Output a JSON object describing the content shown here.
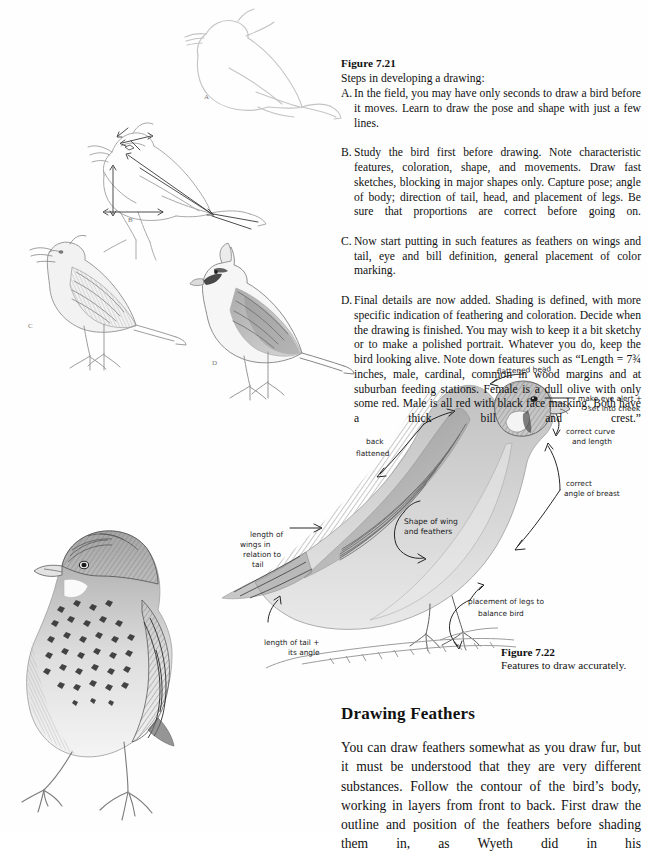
{
  "figure_721": {
    "heading": "Figure 7.21",
    "subtitle": "Steps in developing a drawing:",
    "steps": [
      {
        "letter": "A.",
        "text": "In the field, you may have only seconds to draw a bird before it moves. Learn to draw the pose and shape with just a few lines."
      },
      {
        "letter": "B.",
        "text": "Study the bird first before drawing. Note characteristic features, coloration, shape, and movements. Draw fast sketches, blocking in major shapes only. Capture pose; angle of body; direction of tail, head, and placement of legs. Be sure that proportions are correct before going on."
      },
      {
        "letter": "C.",
        "text": "Now start putting in such features as feathers on wings and tail, eye and bill definition, general placement of color marking."
      },
      {
        "letter": "D.",
        "text": "Final details are now added. Shading is defined, with more specific indication of feathering and coloration. Decide when the drawing is finished. You may wish to keep it a bit sketchy or to make a polished portrait. Whatever you do, keep the bird looking alive. Note down features such as “Length = 7¾ inches, male, cardinal, common in wood margins and at suburban feeding stations. Female is a dull olive with only some red. Male is all red with black face marking. Both have a thick bill and crest.”"
      }
    ]
  },
  "sketch_labels": {
    "a": "A",
    "b": "B",
    "c": "C",
    "d": "D"
  },
  "figure_722": {
    "heading": "Figure 7.22",
    "caption": "Features to draw accurately.",
    "annotations": [
      {
        "id": "flattened-head",
        "text": "flattened head"
      },
      {
        "id": "make-eye-alert",
        "line1": "make eye alert +",
        "line2": "set into cheek"
      },
      {
        "id": "correct-curve",
        "line1": "correct curve",
        "line2": "and length"
      },
      {
        "id": "back-flattened",
        "line1": "back",
        "line2": "flattened"
      },
      {
        "id": "correct-angle-breast",
        "line1": "correct",
        "line2": "angle of breast"
      },
      {
        "id": "shape-of-wing",
        "line1": "Shape of wing",
        "line2": "and feathers"
      },
      {
        "id": "length-of-wings",
        "line1": "length of",
        "line2": "wings in",
        "line3": "relation to",
        "line4": "tail"
      },
      {
        "id": "placement-of-legs",
        "line1": "placement of legs to",
        "line2": "balance bird"
      },
      {
        "id": "length-of-tail",
        "line1": "length of tail +",
        "line2": "its angle"
      }
    ]
  },
  "section_feathers": {
    "heading": "Drawing Feathers",
    "body": "You can draw feathers somewhat as you draw fur, but it must be understood that they are very different substances. Follow the contour of the bird’s body, working in layers from front to back. First draw the outline and position of the feathers before shading them in, as Wyeth did in his"
  },
  "colors": {
    "ink": "#111111",
    "pencil": "#6d6d6d",
    "pencil_light": "#b9b9b9",
    "paper": "#fefefe"
  }
}
